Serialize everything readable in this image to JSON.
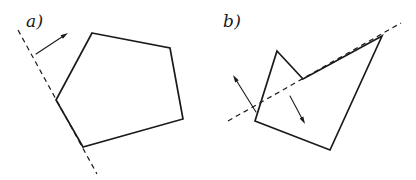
{
  "figure": {
    "background_color": "#ffffff",
    "stroke_color": "#1a1a1a",
    "width": 416,
    "height": 180,
    "panels": [
      {
        "id": "a",
        "label": "a)",
        "label_position": {
          "x": 26,
          "y": 13
        },
        "shape": {
          "name": "convex-pentagon",
          "stroke_width": 1.7,
          "fill": "none",
          "closed": true,
          "vertices": [
            {
              "x": 92,
              "y": 33
            },
            {
              "x": 170,
              "y": 48
            },
            {
              "x": 183,
              "y": 119
            },
            {
              "x": 83,
              "y": 147
            },
            {
              "x": 56,
              "y": 100
            }
          ]
        },
        "mirror_line": {
          "name": "dashed-mirror-line",
          "style": "dashed",
          "stroke_width": 1.2,
          "dash_pattern": "5 4",
          "from": {
            "x": 18,
            "y": 30
          },
          "to": {
            "x": 97,
            "y": 174
          }
        },
        "arrows": [
          {
            "name": "reflection-arrow",
            "stroke_width": 1.1,
            "tail": {
              "x": 36,
              "y": 54
            },
            "tip": {
              "x": 68,
              "y": 33
            }
          }
        ]
      },
      {
        "id": "b",
        "label": "b)",
        "label_position": {
          "x": 223,
          "y": 13
        },
        "shape": {
          "name": "concave-polygon",
          "stroke_width": 1.7,
          "fill": "none",
          "closed": true,
          "vertices": [
            {
              "x": 277,
              "y": 51
            },
            {
              "x": 303,
              "y": 79
            },
            {
              "x": 382,
              "y": 36
            },
            {
              "x": 330,
              "y": 150
            },
            {
              "x": 255,
              "y": 121
            }
          ]
        },
        "mirror_line": {
          "name": "dashed-mirror-line",
          "style": "dashed",
          "stroke_width": 1.2,
          "dash_pattern": "5 4",
          "from": {
            "x": 228,
            "y": 121
          },
          "to": {
            "x": 401,
            "y": 23
          }
        },
        "arrows": [
          {
            "name": "reflection-arrow-up-left",
            "stroke_width": 1.1,
            "tail": {
              "x": 256,
              "y": 112
            },
            "tip": {
              "x": 233,
              "y": 75
            }
          },
          {
            "name": "reflection-arrow-down-right",
            "stroke_width": 1.1,
            "tail": {
              "x": 290,
              "y": 96
            },
            "tip": {
              "x": 305,
              "y": 124
            }
          }
        ]
      }
    ]
  }
}
